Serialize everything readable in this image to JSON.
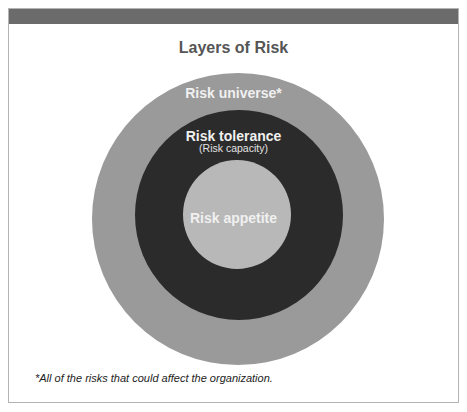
{
  "diagram": {
    "title": "Layers of Risk",
    "type": "concentric-circles",
    "layers": [
      {
        "name": "Risk universe*",
        "sublabel": "",
        "position": "outer",
        "color": "#9a9a9a"
      },
      {
        "name": "Risk tolerance",
        "sublabel": "(Risk capacity)",
        "position": "middle",
        "color": "#2b2b2b"
      },
      {
        "name": "Risk appetite",
        "sublabel": "",
        "position": "inner",
        "color": "#b8b8b8"
      }
    ],
    "footnote": "*All of the risks that could affect the organization.",
    "colors": {
      "header_bar": "#6b6b6b",
      "title_text": "#555555",
      "layer_text": "#f0f0f0",
      "frame_border": "#b4b4b4"
    }
  }
}
